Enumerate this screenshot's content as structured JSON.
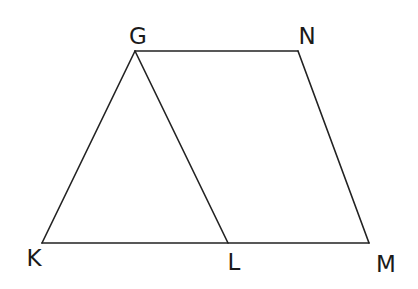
{
  "diagram": {
    "stroke_color": "#222222",
    "points": {
      "G": {
        "label": "G",
        "x": 135,
        "y": 51,
        "label_x": 138,
        "label_y": 44
      },
      "N": {
        "label": "N",
        "x": 298,
        "y": 51,
        "label_x": 307,
        "label_y": 44
      },
      "K": {
        "label": "K",
        "x": 42,
        "y": 243,
        "label_x": 34,
        "label_y": 266
      },
      "L": {
        "label": "L",
        "x": 228,
        "y": 243,
        "label_x": 234,
        "label_y": 270
      },
      "M": {
        "label": "M",
        "x": 369,
        "y": 243,
        "label_x": 386,
        "label_y": 272
      }
    },
    "segments": [
      {
        "from": "G",
        "to": "N"
      },
      {
        "from": "N",
        "to": "M"
      },
      {
        "from": "K",
        "to": "M"
      },
      {
        "from": "G",
        "to": "K"
      },
      {
        "from": "G",
        "to": "L"
      }
    ]
  }
}
